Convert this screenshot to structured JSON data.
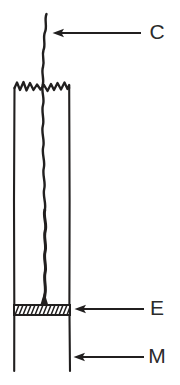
{
  "figure": {
    "background_color": "#ffffff",
    "ink_color": "#211f1f",
    "width": 180,
    "height": 385
  },
  "labels": [
    {
      "id": "C",
      "text": "C",
      "meaning": "crack",
      "x": 157,
      "y": 33,
      "arrow": {
        "from_x": 141,
        "to_x": 53,
        "y": 33,
        "direction": "left"
      }
    },
    {
      "id": "E",
      "text": "E",
      "meaning": "epoxy-layer",
      "x": 157,
      "y": 309,
      "arrow": {
        "from_x": 144,
        "to_x": 75,
        "y": 309,
        "direction": "left"
      }
    },
    {
      "id": "M",
      "text": "M",
      "meaning": "mount-material",
      "x": 157,
      "y": 357,
      "arrow": {
        "from_x": 144,
        "to_x": 74,
        "y": 357,
        "direction": "left"
      }
    }
  ],
  "specimen": {
    "left_wall_x": 14,
    "right_wall_x": 69,
    "wall_top_y": 88,
    "wall_bottom_y": 371,
    "torn_top_edge": {
      "description": "jagged zigzag break line across specimen top",
      "y_base": 88,
      "peak_amplitude": 8
    }
  },
  "crack": {
    "description": "wavy vertical crack running from above the torn top edge down to the epoxy layer",
    "top_y": 14,
    "bottom_y": 306,
    "nominal_x": 44
  },
  "epoxy_band": {
    "left_x": 14,
    "right_x": 70,
    "top_y": 305,
    "bottom_y": 315,
    "fill_pattern": "diagonal-hatch",
    "hatch_count": 14
  }
}
